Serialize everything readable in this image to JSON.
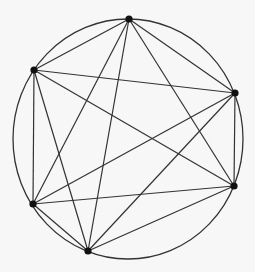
{
  "diagram": {
    "type": "complete-graph-K6-inscribed-in-circle",
    "background_color": "#f7f7f7",
    "line_color": "#333333",
    "vertex_color": "#111111",
    "circle": {
      "cx": 128,
      "cy": 139,
      "rx": 115,
      "ry": 120
    },
    "vertices": [
      {
        "id": "A",
        "x": 129,
        "y": 19
      },
      {
        "id": "B",
        "x": 34,
        "y": 70
      },
      {
        "id": "C",
        "x": 235,
        "y": 93
      },
      {
        "id": "D",
        "x": 234,
        "y": 186
      },
      {
        "id": "E",
        "x": 33,
        "y": 204
      },
      {
        "id": "F",
        "x": 88,
        "y": 251
      }
    ],
    "edges": [
      [
        "A",
        "B"
      ],
      [
        "A",
        "C"
      ],
      [
        "A",
        "D"
      ],
      [
        "A",
        "E"
      ],
      [
        "A",
        "F"
      ],
      [
        "B",
        "C"
      ],
      [
        "B",
        "D"
      ],
      [
        "B",
        "E"
      ],
      [
        "B",
        "F"
      ],
      [
        "C",
        "D"
      ],
      [
        "C",
        "E"
      ],
      [
        "C",
        "F"
      ],
      [
        "D",
        "E"
      ],
      [
        "D",
        "F"
      ],
      [
        "E",
        "F"
      ]
    ]
  }
}
